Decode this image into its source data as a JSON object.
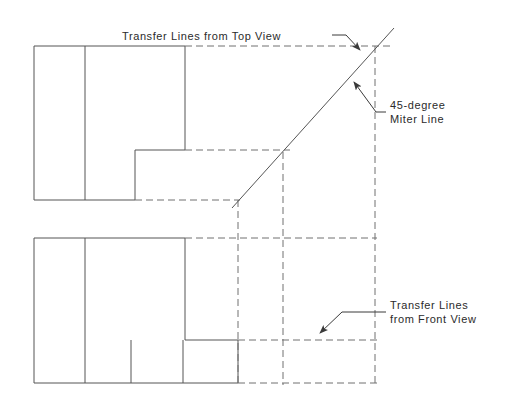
{
  "drawing": {
    "title": "Orthographic Projection with 45-degree Miter Line",
    "stroke_color": "#4a4a4a",
    "dashed_color": "#6e6e6e",
    "text_color": "#2b2b2b",
    "background": "#ffffff",
    "canvas": {
      "width": 508,
      "height": 398
    }
  },
  "annotations": {
    "top_label": {
      "text": "Transfer Lines from Top View",
      "x": 122,
      "y": 40
    },
    "miter_label": {
      "line1": "45-degree",
      "line2": "Miter Line",
      "x": 390,
      "y1": 109,
      "y2": 123
    },
    "front_label": {
      "line1": "Transfer Lines",
      "line2": "from Front View",
      "x": 390,
      "y1": 309,
      "y2": 323
    }
  },
  "views": {
    "top_view": {
      "name": "Top View",
      "outline": "M34,46 L185,46 L185,150 L135,150 L135,200 L34,200 Z",
      "interior_vertical": {
        "x": 85,
        "y1": 46,
        "y2": 200
      }
    },
    "front_view": {
      "name": "Front View",
      "outline": "M34,238 L185,238 L185,340 L34,340 L34,383 L238,383 L238,340 L185,340",
      "outline_simple": "M34,238 L85,238 L85,383 L34,383 Z",
      "interior_verticals": [
        {
          "x": 131,
          "y1": 340,
          "y2": 383
        },
        {
          "x": 183,
          "y1": 340,
          "y2": 383
        }
      ]
    }
  },
  "miter_line": {
    "name": "45-degree Miter Line",
    "x1": 232,
    "y1": 208,
    "x2": 394,
    "y2": 28,
    "angle_degrees": 45
  },
  "transfer_lines": {
    "horizontal_from_top": [
      {
        "x1": 185,
        "y1": 46,
        "x2": 394,
        "y2": 46
      },
      {
        "x1": 185,
        "y1": 150,
        "x2": 290,
        "y2": 150
      },
      {
        "x1": 135,
        "y1": 200,
        "x2": 238,
        "y2": 200
      }
    ],
    "vertical_to_side": [
      {
        "x": 238,
        "y1": 200,
        "x2": 238,
        "y2": 383
      },
      {
        "x": 283,
        "y1": 155,
        "x2": 283,
        "y2": 383
      },
      {
        "x": 375,
        "y1": 46,
        "x2": 375,
        "y2": 383
      }
    ],
    "horizontal_from_front": [
      {
        "x1": 185,
        "y1": 238,
        "x2": 375,
        "y2": 238
      },
      {
        "x1": 238,
        "y1": 340,
        "x2": 375,
        "y2": 340
      },
      {
        "x1": 238,
        "y1": 383,
        "x2": 375,
        "y2": 383
      }
    ]
  },
  "leaders": {
    "top_leader": {
      "path": "M335,36 L348,36 L360,50",
      "arrow_at": {
        "x": 360,
        "y": 50
      }
    },
    "miter_leader": {
      "path": "M387,112 L375,112 L352,80",
      "arrow_at": {
        "x": 352,
        "y": 80
      }
    },
    "front_leader": {
      "path": "M387,312 L340,312 L318,334",
      "arrow_at": {
        "x": 318,
        "y": 334
      }
    }
  }
}
